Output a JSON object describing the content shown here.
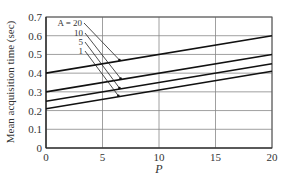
{
  "chart_data": {
    "type": "line",
    "title": "",
    "xlabel": "P",
    "ylabel": "Mean acquisition time (sec)",
    "xlim": [
      0,
      20
    ],
    "ylim": [
      0,
      0.7
    ],
    "x_ticks": [
      "0",
      "5",
      "10",
      "15",
      "20"
    ],
    "y_ticks": [
      "0",
      "0.1",
      "0.2",
      "0.3",
      "0.4",
      "0.5",
      "0.6",
      "0.7"
    ],
    "grid": true,
    "legend_position": "annotations with arrows, upper left",
    "x": [
      0,
      20
    ],
    "series": [
      {
        "name": "A = 20",
        "values": [
          0.4,
          0.6
        ]
      },
      {
        "name": "10",
        "values": [
          0.3,
          0.5
        ]
      },
      {
        "name": "5",
        "values": [
          0.25,
          0.45
        ]
      },
      {
        "name": "1",
        "values": [
          0.21,
          0.41
        ]
      }
    ]
  }
}
